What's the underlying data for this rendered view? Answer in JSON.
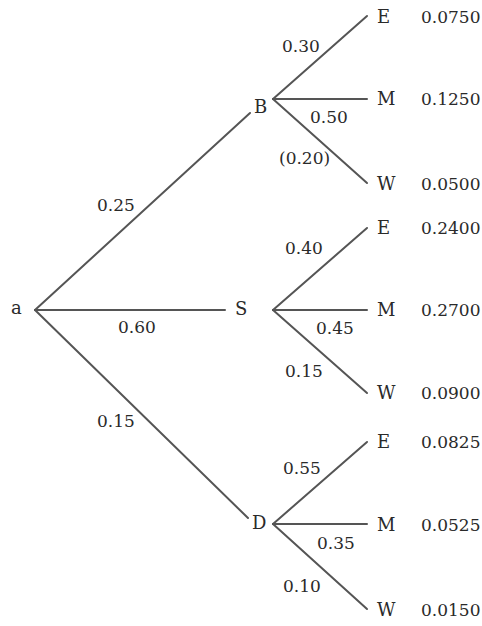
{
  "diagram": {
    "type": "probability-tree",
    "root": {
      "label": "a"
    },
    "branches": [
      {
        "node": "B",
        "prob": "0.25",
        "children": [
          {
            "label": "E",
            "prob": "0.30",
            "joint": "0.0750"
          },
          {
            "label": "M",
            "prob": "0.50",
            "joint": "0.1250"
          },
          {
            "label": "W",
            "prob": "(0.20)",
            "joint": "0.0500"
          }
        ]
      },
      {
        "node": "S",
        "prob": "0.60",
        "children": [
          {
            "label": "E",
            "prob": "0.40",
            "joint": "0.2400"
          },
          {
            "label": "M",
            "prob": "0.45",
            "joint": "0.2700"
          },
          {
            "label": "W",
            "prob": "0.15",
            "joint": "0.0900"
          }
        ]
      },
      {
        "node": "D",
        "prob": "0.15",
        "children": [
          {
            "label": "E",
            "prob": "0.55",
            "joint": "0.0825"
          },
          {
            "label": "M",
            "prob": "0.35",
            "joint": "0.0525"
          },
          {
            "label": "W",
            "prob": "0.10",
            "joint": "0.0150"
          }
        ]
      }
    ]
  },
  "colors": {
    "line": "#555555",
    "text": "#2a2a2a",
    "background": "#ffffff"
  }
}
